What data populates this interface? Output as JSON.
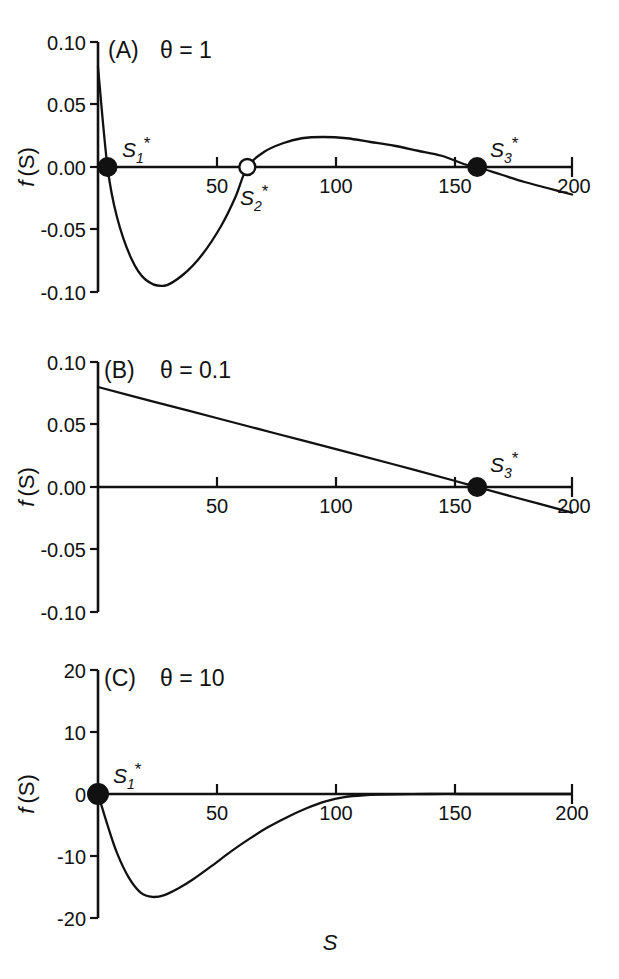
{
  "figure": {
    "xlabel": "S",
    "ylabel_f": "f",
    "ylabel_s": "(S)"
  },
  "chart_data": [
    {
      "type": "line",
      "panel": "A",
      "panel_label": "(A)",
      "annotation": "θ = 1",
      "theta": 1,
      "title": "",
      "xlabel": "S",
      "ylabel": "f (S)",
      "xlim": [
        0,
        200
      ],
      "ylim": [
        -0.1,
        0.1
      ],
      "xticks": [
        50,
        100,
        150,
        200
      ],
      "xticklabels": [
        "50",
        "100",
        "150",
        "200"
      ],
      "yticks": [
        0.1,
        0.05,
        0.0,
        -0.05,
        -0.1
      ],
      "yticklabels": [
        "0.10",
        "0.05",
        "0.00",
        "-0.05",
        "-0.10"
      ],
      "grid": false,
      "legend": "none",
      "x": [
        0,
        4,
        8,
        14,
        20,
        28,
        36,
        44,
        52,
        58,
        63,
        70,
        78,
        86,
        95,
        105,
        115,
        125,
        135,
        145,
        155,
        160,
        170,
        180,
        190,
        200
      ],
      "y": [
        0.08,
        0.0,
        -0.04,
        -0.073,
        -0.09,
        -0.095,
        -0.086,
        -0.07,
        -0.047,
        -0.024,
        0.0,
        0.012,
        0.019,
        0.023,
        0.024,
        0.023,
        0.02,
        0.017,
        0.013,
        0.009,
        0.002,
        0.0,
        -0.006,
        -0.012,
        -0.017,
        -0.022
      ],
      "markers": [
        {
          "name": "S1*",
          "label_base": "S",
          "label_sub": "1",
          "label_star": "*",
          "x": 4,
          "y": 0,
          "style": "filled"
        },
        {
          "name": "S2*",
          "label_base": "S",
          "label_sub": "2",
          "label_star": "*",
          "x": 63,
          "y": 0,
          "style": "open"
        },
        {
          "name": "S3*",
          "label_base": "S",
          "label_sub": "3",
          "label_star": "*",
          "x": 160,
          "y": 0,
          "style": "filled"
        }
      ]
    },
    {
      "type": "line",
      "panel": "B",
      "panel_label": "(B)",
      "annotation": "θ = 0.1",
      "theta": 0.1,
      "title": "",
      "xlabel": "S",
      "ylabel": "f (S)",
      "xlim": [
        0,
        200
      ],
      "ylim": [
        -0.1,
        0.1
      ],
      "xticks": [
        50,
        100,
        150,
        200
      ],
      "xticklabels": [
        "50",
        "100",
        "150",
        "200"
      ],
      "yticks": [
        0.1,
        0.05,
        0.0,
        -0.05,
        -0.1
      ],
      "yticklabels": [
        "0.10",
        "0.05",
        "0.00",
        "-0.05",
        "-0.10"
      ],
      "grid": false,
      "legend": "none",
      "x": [
        0,
        25,
        50,
        75,
        100,
        125,
        150,
        160,
        175,
        200
      ],
      "y": [
        0.08,
        0.0675,
        0.0552,
        0.0428,
        0.0305,
        0.018,
        0.0052,
        0.0,
        -0.0078,
        -0.0205
      ],
      "markers": [
        {
          "name": "S3*",
          "label_base": "S",
          "label_sub": "3",
          "label_star": "*",
          "x": 160,
          "y": 0,
          "style": "filled"
        }
      ]
    },
    {
      "type": "line",
      "panel": "C",
      "panel_label": "(C)",
      "annotation": "θ = 10",
      "theta": 10,
      "title": "",
      "xlabel": "S",
      "ylabel": "f (S)",
      "xlim": [
        0,
        200
      ],
      "ylim": [
        -20,
        20
      ],
      "xticks": [
        50,
        100,
        150,
        200
      ],
      "xticklabels": [
        "50",
        "100",
        "150",
        "200"
      ],
      "yticks": [
        20,
        10,
        0,
        -10,
        -20
      ],
      "yticklabels": [
        "20",
        "10",
        "0",
        "-10",
        "-20"
      ],
      "grid": false,
      "legend": "none",
      "x": [
        0,
        4,
        8,
        13,
        18,
        23,
        28,
        34,
        40,
        48,
        56,
        64,
        72,
        80,
        88,
        96,
        104,
        112,
        120,
        140,
        160,
        180,
        200
      ],
      "y": [
        0.0,
        -5.0,
        -9.5,
        -13.5,
        -15.9,
        -16.6,
        -16.3,
        -15.2,
        -13.8,
        -11.6,
        -9.3,
        -7.2,
        -5.3,
        -3.7,
        -2.3,
        -1.2,
        -0.5,
        -0.2,
        -0.1,
        0.0,
        0.0,
        0.0,
        0.0
      ],
      "markers": [
        {
          "name": "S1*",
          "label_base": "S",
          "label_sub": "1",
          "label_star": "*",
          "x": 0,
          "y": 0,
          "style": "filled"
        }
      ]
    }
  ]
}
